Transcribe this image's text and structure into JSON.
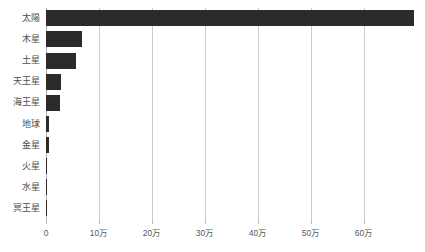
{
  "chart_data": {
    "type": "bar",
    "orientation": "horizontal",
    "title": "",
    "subtitle": "",
    "xlabel": "",
    "ylabel": "",
    "categories": [
      "太陽",
      "木星",
      "土星",
      "天王星",
      "海王星",
      "地球",
      "金星",
      "火星",
      "水星",
      "冥王星"
    ],
    "values": [
      1392000,
      142984,
      120536,
      51118,
      49528,
      12756,
      12104,
      6792,
      4879,
      2376
    ],
    "values_plotted": [
      694000,
      68000,
      57000,
      28000,
      26000,
      6000,
      5500,
      2000,
      1500,
      700
    ],
    "xlim": [
      0,
      694000
    ],
    "xticks": [
      0,
      100000,
      200000,
      300000,
      400000,
      500000,
      600000
    ],
    "xticklabels": [
      "0",
      "10万",
      "20万",
      "30万",
      "40万",
      "50万",
      "60万"
    ],
    "grid": true,
    "grid_axis": "x",
    "legend": false,
    "legend_position": "none",
    "bar_color": "#2b2b2b",
    "grid_color": "#cccccc",
    "axis_color": "#b0b0b0",
    "text_color": "#4d4d4d",
    "background": "#ffffff",
    "series": [
      {
        "name": "直径",
        "values": [
          694000,
          68000,
          57000,
          28000,
          26000,
          6000,
          5500,
          2000,
          1500,
          700
        ]
      }
    ]
  },
  "axis": {
    "tick_labels": [
      "0",
      "10万",
      "20万",
      "30万",
      "40万",
      "50万",
      "60万"
    ]
  }
}
